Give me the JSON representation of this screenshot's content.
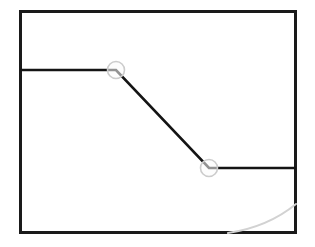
{
  "figure": {
    "canvas": {
      "width": 315,
      "height": 247,
      "background_color": "#ffffff"
    },
    "frame": {
      "label": "Diagram frame",
      "x": 20.5,
      "y": 11.5,
      "width": 275,
      "height": 221,
      "stroke_color": "#1a1a1a",
      "stroke_width": 2.4,
      "fill_color": "#ffffff"
    },
    "polyline": {
      "label": "Step-down signal trace",
      "stroke_color": "#141414",
      "stroke_width": 2.6,
      "points": "20,70 116,70 209,168 296,168",
      "vertices": [
        {
          "name": "left-edge-start",
          "x": 20,
          "y": 70
        },
        {
          "name": "upper-knee",
          "x": 116,
          "y": 70
        },
        {
          "name": "lower-knee",
          "x": 209,
          "y": 168
        },
        {
          "name": "right-edge-end",
          "x": 296,
          "y": 168
        }
      ]
    },
    "markers": [
      {
        "name": "upper-knee-marker",
        "cx": 116,
        "cy": 70,
        "r": 8.5,
        "stroke_color": "#cccccc",
        "stroke_width": 1.6,
        "fill_color": "#fbfbfb"
      },
      {
        "name": "lower-knee-marker",
        "cx": 209,
        "cy": 168,
        "r": 8.5,
        "stroke_color": "#cccccc",
        "stroke_width": 1.6,
        "fill_color": "#fbfbfb"
      }
    ],
    "arc": {
      "label": "Faint background arc",
      "path": "M 228 233 Q 268 227 296 204",
      "stroke_color": "#d2d2d2",
      "stroke_width": 2.0
    }
  },
  "chart_data": {
    "type": "line",
    "xlabel": "",
    "ylabel": "",
    "grid": false,
    "legend": "none",
    "xlim": [
      20,
      296
    ],
    "ylim": [
      233,
      11
    ],
    "series": [
      {
        "name": "step-down trace",
        "x": [
          20,
          116,
          209,
          296
        ],
        "y": [
          70,
          70,
          168,
          168
        ],
        "marker_points": [
          {
            "x": 116,
            "y": 70
          },
          {
            "x": 209,
            "y": 168
          }
        ]
      },
      {
        "name": "faint arc",
        "x": [
          228,
          268,
          296
        ],
        "y": [
          233,
          222,
          204
        ]
      }
    ]
  }
}
